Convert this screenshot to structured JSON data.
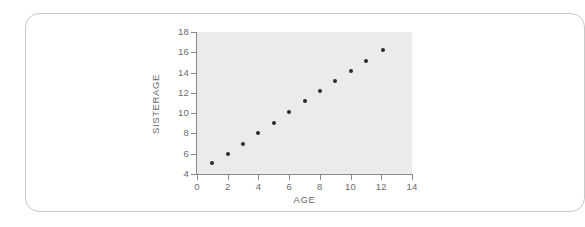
{
  "chart_data": {
    "type": "scatter",
    "title": "",
    "xlabel": "AGE",
    "ylabel": "SISTERAGE",
    "xlim": [
      0,
      14
    ],
    "ylim": [
      4,
      18
    ],
    "xticks": [
      0,
      2,
      4,
      6,
      8,
      10,
      12,
      14
    ],
    "yticks": [
      4,
      6,
      8,
      10,
      12,
      14,
      16,
      18
    ],
    "grid": false,
    "legend": null,
    "plot_background": "#ebebeb",
    "marker_color": "#2b2b2b",
    "axis_color": "#8a8a8a",
    "tick_label_color": "#6b6b6b",
    "x": [
      1.0,
      2.0,
      3.0,
      4.0,
      5.0,
      6.0,
      7.0,
      8.0,
      9.0,
      10.0,
      11.0,
      12.1
    ],
    "y": [
      5.05,
      6.0,
      7.0,
      8.0,
      9.05,
      10.1,
      11.15,
      12.15,
      13.15,
      14.15,
      15.15,
      16.2
    ],
    "points": [
      {
        "x": 1.0,
        "y": 5.05
      },
      {
        "x": 2.0,
        "y": 6.0
      },
      {
        "x": 3.0,
        "y": 7.0
      },
      {
        "x": 4.0,
        "y": 8.0
      },
      {
        "x": 5.0,
        "y": 9.05
      },
      {
        "x": 6.0,
        "y": 10.1
      },
      {
        "x": 7.0,
        "y": 11.15
      },
      {
        "x": 8.0,
        "y": 12.15
      },
      {
        "x": 9.0,
        "y": 13.15
      },
      {
        "x": 10.0,
        "y": 14.15
      },
      {
        "x": 11.0,
        "y": 15.15
      },
      {
        "x": 12.1,
        "y": 16.2
      }
    ]
  },
  "card": {
    "border_color": "#c9c9c9",
    "background": "#ffffff"
  }
}
